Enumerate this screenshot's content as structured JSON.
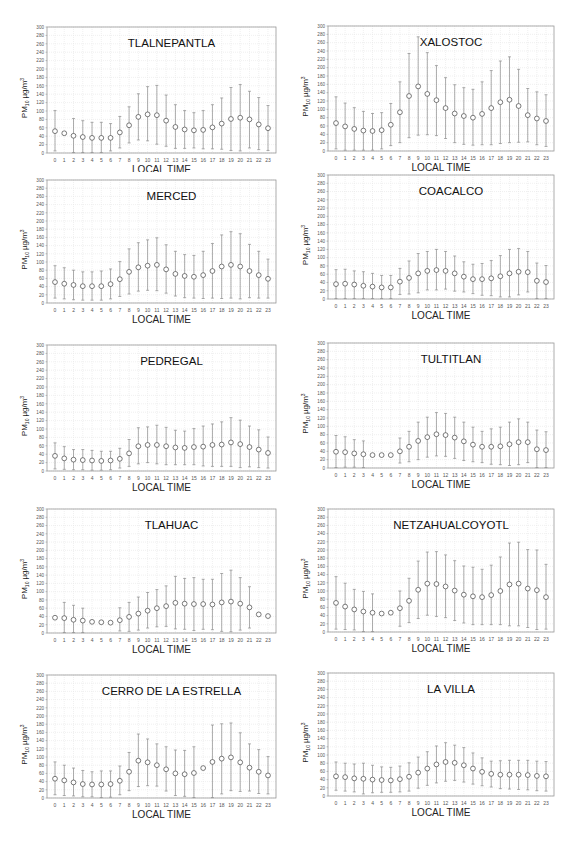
{
  "figure": {
    "ylabel_main": "PM",
    "ylabel_sub": "10",
    "ylabel_unit": "µg/m",
    "ylabel_sup": "3",
    "xlabel": "LOCAL TIME",
    "y_ticks": [
      0,
      20,
      40,
      60,
      80,
      100,
      120,
      140,
      160,
      180,
      200,
      220,
      240,
      260,
      280,
      300
    ],
    "x_ticks": [
      0,
      1,
      2,
      3,
      4,
      5,
      6,
      7,
      8,
      9,
      10,
      11,
      12,
      13,
      14,
      15,
      16,
      17,
      18,
      19,
      20,
      21,
      22,
      23
    ]
  },
  "chart_data": [
    {
      "type": "scatter",
      "title": "TLALNEPANTLA",
      "xlabel": "LOCAL TIME",
      "ylabel": "PM10 µg/m3",
      "ylim": [
        0,
        300
      ],
      "xlim": [
        0,
        23
      ],
      "grid": true,
      "x": [
        0,
        1,
        2,
        3,
        4,
        5,
        6,
        7,
        8,
        9,
        10,
        11,
        12,
        13,
        14,
        15,
        16,
        17,
        18,
        19,
        20,
        21,
        22,
        23
      ],
      "mean": [
        52,
        47,
        41,
        38,
        36,
        36,
        36,
        49,
        66,
        86,
        92,
        90,
        77,
        62,
        56,
        54,
        55,
        61,
        70,
        81,
        84,
        80,
        68,
        59
      ],
      "upper": [
        101,
        null,
        82,
        77,
        73,
        73,
        70,
        87,
        110,
        141,
        158,
        161,
        138,
        115,
        101,
        96,
        101,
        115,
        131,
        156,
        163,
        147,
        132,
        113
      ],
      "lower": [
        5,
        null,
        1,
        1,
        1,
        1,
        5,
        12,
        24,
        31,
        29,
        21,
        16,
        11,
        11,
        12,
        10,
        10,
        9,
        6,
        5,
        12,
        8,
        6
      ]
    },
    {
      "type": "scatter",
      "title": "XALOSTOC",
      "xlabel": "LOCAL TIME",
      "ylabel": "PM10 µg/m3",
      "ylim": [
        0,
        300
      ],
      "xlim": [
        0,
        23
      ],
      "grid": true,
      "x": [
        0,
        1,
        2,
        3,
        4,
        5,
        6,
        7,
        8,
        9,
        10,
        11,
        12,
        13,
        14,
        15,
        16,
        17,
        18,
        19,
        20,
        21,
        22,
        23
      ],
      "mean": [
        67,
        59,
        53,
        49,
        48,
        50,
        63,
        93,
        132,
        155,
        137,
        122,
        103,
        90,
        84,
        80,
        89,
        103,
        117,
        123,
        108,
        86,
        78,
        72
      ],
      "upper": [
        130,
        115,
        104,
        95,
        90,
        92,
        114,
        166,
        234,
        274,
        236,
        205,
        176,
        159,
        152,
        148,
        166,
        193,
        216,
        226,
        196,
        150,
        142,
        135
      ],
      "lower": [
        5,
        2,
        2,
        2,
        2,
        5,
        13,
        20,
        32,
        38,
        39,
        37,
        30,
        20,
        16,
        14,
        15,
        15,
        18,
        20,
        21,
        22,
        15,
        11
      ]
    },
    {
      "type": "scatter",
      "title": "MERCED",
      "xlabel": "LOCAL TIME",
      "ylabel": "PM10 µg/m3",
      "ylim": [
        0,
        300
      ],
      "xlim": [
        0,
        23
      ],
      "grid": true,
      "x": [
        0,
        1,
        2,
        3,
        4,
        5,
        6,
        7,
        8,
        9,
        10,
        11,
        12,
        13,
        14,
        15,
        16,
        17,
        18,
        19,
        20,
        21,
        22,
        23
      ],
      "mean": [
        51,
        47,
        44,
        41,
        41,
        41,
        46,
        58,
        76,
        87,
        91,
        93,
        82,
        71,
        66,
        64,
        68,
        78,
        89,
        93,
        89,
        78,
        68,
        59
      ],
      "upper": [
        91,
        86,
        80,
        76,
        76,
        78,
        83,
        101,
        132,
        147,
        154,
        159,
        142,
        126,
        118,
        116,
        126,
        145,
        166,
        174,
        169,
        143,
        126,
        107
      ],
      "lower": [
        12,
        10,
        8,
        7,
        7,
        7,
        10,
        16,
        22,
        29,
        31,
        30,
        24,
        17,
        13,
        12,
        11,
        12,
        11,
        12,
        10,
        13,
        12,
        12
      ]
    },
    {
      "type": "scatter",
      "title": "COACALCO",
      "xlabel": "LOCAL TIME",
      "ylabel": "PM10 µg/m3",
      "ylim": [
        0,
        300
      ],
      "xlim": [
        0,
        23
      ],
      "grid": true,
      "x": [
        0,
        1,
        2,
        3,
        4,
        5,
        6,
        7,
        8,
        9,
        10,
        11,
        12,
        13,
        14,
        15,
        16,
        17,
        18,
        19,
        20,
        21,
        22,
        23
      ],
      "mean": [
        36,
        37,
        35,
        32,
        30,
        28,
        28,
        42,
        51,
        62,
        68,
        70,
        68,
        62,
        54,
        48,
        48,
        50,
        55,
        62,
        66,
        65,
        44,
        41
      ],
      "upper": [
        71,
        72,
        68,
        66,
        62,
        57,
        57,
        74,
        92,
        110,
        115,
        120,
        115,
        104,
        90,
        84,
        86,
        93,
        105,
        120,
        122,
        115,
        87,
        81
      ],
      "lower": [
        1,
        1,
        1,
        1,
        1,
        1,
        1,
        11,
        12,
        15,
        22,
        22,
        24,
        19,
        17,
        13,
        9,
        8,
        5,
        5,
        10,
        17,
        1,
        1
      ]
    },
    {
      "type": "scatter",
      "title": "PEDREGAL",
      "xlabel": "LOCAL TIME",
      "ylabel": "PM10 µg/m3",
      "ylim": [
        0,
        300
      ],
      "xlim": [
        0,
        23
      ],
      "grid": true,
      "x": [
        0,
        1,
        2,
        3,
        4,
        5,
        6,
        7,
        8,
        9,
        10,
        11,
        12,
        13,
        14,
        15,
        16,
        17,
        18,
        19,
        20,
        21,
        22,
        23
      ],
      "mean": [
        36,
        30,
        27,
        26,
        25,
        24,
        25,
        29,
        42,
        59,
        62,
        62,
        59,
        56,
        55,
        57,
        58,
        62,
        63,
        68,
        64,
        57,
        51,
        43
      ],
      "upper": [
        67,
        58,
        51,
        51,
        49,
        47,
        47,
        54,
        75,
        103,
        105,
        109,
        104,
        97,
        95,
        101,
        107,
        112,
        117,
        127,
        121,
        107,
        98,
        81
      ],
      "lower": [
        5,
        4,
        3,
        3,
        2,
        2,
        3,
        7,
        11,
        17,
        20,
        17,
        15,
        15,
        15,
        15,
        12,
        11,
        11,
        11,
        8,
        10,
        8,
        7
      ]
    },
    {
      "type": "scatter",
      "title": "TULTITLAN",
      "xlabel": "LOCAL TIME",
      "ylabel": "PM10 µg/m3",
      "ylim": [
        0,
        300
      ],
      "xlim": [
        0,
        23
      ],
      "grid": true,
      "x": [
        0,
        1,
        2,
        3,
        4,
        5,
        6,
        7,
        8,
        9,
        10,
        11,
        12,
        13,
        14,
        15,
        16,
        17,
        18,
        19,
        20,
        21,
        22,
        23
      ],
      "mean": [
        39,
        38,
        35,
        33,
        31,
        31,
        31,
        40,
        51,
        65,
        74,
        81,
        79,
        73,
        64,
        56,
        51,
        51,
        52,
        57,
        62,
        62,
        45,
        43
      ],
      "upper": [
        78,
        75,
        68,
        65,
        null,
        null,
        null,
        72,
        88,
        110,
        122,
        133,
        131,
        122,
        110,
        98,
        88,
        94,
        98,
        110,
        118,
        110,
        91,
        87
      ],
      "lower": [
        1,
        2,
        2,
        1,
        null,
        null,
        null,
        12,
        15,
        20,
        26,
        29,
        28,
        23,
        18,
        15,
        13,
        9,
        8,
        6,
        8,
        13,
        1,
        1
      ]
    },
    {
      "type": "scatter",
      "title": "TLAHUAC",
      "xlabel": "LOCAL TIME",
      "ylabel": "PM10 µg/m3",
      "ylim": [
        0,
        300
      ],
      "xlim": [
        0,
        23
      ],
      "grid": true,
      "x": [
        0,
        1,
        2,
        3,
        4,
        5,
        6,
        7,
        8,
        9,
        10,
        11,
        12,
        13,
        14,
        15,
        16,
        17,
        18,
        19,
        20,
        21,
        22,
        23
      ],
      "mean": [
        37,
        36,
        32,
        30,
        27,
        26,
        25,
        31,
        39,
        47,
        54,
        60,
        65,
        73,
        71,
        70,
        70,
        69,
        74,
        76,
        71,
        62,
        45,
        41
      ],
      "upper": [
        null,
        74,
        67,
        60,
        null,
        null,
        null,
        61,
        74,
        87,
        98,
        105,
        114,
        137,
        132,
        134,
        130,
        130,
        144,
        152,
        134,
        112,
        null,
        null
      ],
      "lower": [
        null,
        1,
        1,
        1,
        null,
        null,
        null,
        5,
        4,
        7,
        12,
        15,
        16,
        10,
        9,
        6,
        9,
        8,
        4,
        3,
        7,
        12,
        null,
        null
      ]
    },
    {
      "type": "scatter",
      "title": "NETZAHUALCOYOTL",
      "xlabel": "LOCAL TIME",
      "ylabel": "PM10 µg/m3",
      "ylim": [
        0,
        300
      ],
      "xlim": [
        0,
        23
      ],
      "grid": true,
      "x": [
        0,
        1,
        2,
        3,
        4,
        5,
        6,
        7,
        8,
        9,
        10,
        11,
        12,
        13,
        14,
        15,
        16,
        17,
        18,
        19,
        20,
        21,
        22,
        23
      ],
      "mean": [
        71,
        62,
        55,
        50,
        47,
        45,
        47,
        58,
        76,
        103,
        118,
        117,
        111,
        101,
        91,
        87,
        85,
        90,
        100,
        116,
        118,
        106,
        102,
        85
      ],
      "upper": [
        135,
        119,
        104,
        99,
        93,
        null,
        null,
        100,
        131,
        173,
        195,
        196,
        188,
        174,
        161,
        158,
        153,
        163,
        183,
        217,
        219,
        201,
        200,
        165
      ],
      "lower": [
        7,
        6,
        5,
        1,
        1,
        null,
        null,
        14,
        23,
        33,
        41,
        38,
        35,
        28,
        22,
        18,
        18,
        18,
        18,
        15,
        15,
        11,
        6,
        7
      ]
    },
    {
      "type": "scatter",
      "title": "CERRO DE LA ESTRELLA",
      "xlabel": "LOCAL TIME",
      "ylabel": "PM10 µg/m3",
      "ylim": [
        0,
        300
      ],
      "xlim": [
        0,
        23
      ],
      "grid": true,
      "x": [
        0,
        1,
        2,
        3,
        4,
        5,
        6,
        7,
        8,
        9,
        10,
        11,
        12,
        13,
        14,
        15,
        16,
        17,
        18,
        19,
        20,
        21,
        22,
        23
      ],
      "mean": [
        47,
        43,
        38,
        34,
        33,
        33,
        34,
        42,
        64,
        91,
        87,
        80,
        70,
        60,
        58,
        61,
        73,
        88,
        96,
        99,
        87,
        74,
        64,
        55
      ],
      "upper": [
        88,
        80,
        73,
        67,
        64,
        66,
        66,
        78,
        111,
        156,
        144,
        132,
        125,
        117,
        116,
        125,
        null,
        178,
        181,
        183,
        159,
        132,
        118,
        101
      ],
      "lower": [
        8,
        6,
        5,
        3,
        3,
        1,
        2,
        8,
        18,
        28,
        30,
        29,
        17,
        6,
        4,
        1,
        null,
        1,
        10,
        18,
        16,
        17,
        11,
        10
      ]
    },
    {
      "type": "scatter",
      "title": "LA VILLA",
      "xlabel": "LOCAL TIME",
      "ylabel": "PM10 µg/m3",
      "ylim": [
        0,
        300
      ],
      "xlim": [
        0,
        23
      ],
      "grid": true,
      "x": [
        0,
        1,
        2,
        3,
        4,
        5,
        6,
        7,
        8,
        9,
        10,
        11,
        12,
        13,
        14,
        15,
        16,
        17,
        18,
        19,
        20,
        21,
        22,
        23
      ],
      "mean": [
        48,
        46,
        43,
        42,
        40,
        39,
        38,
        41,
        47,
        57,
        67,
        77,
        83,
        81,
        75,
        67,
        59,
        54,
        52,
        52,
        52,
        51,
        49,
        48
      ],
      "upper": [
        83,
        80,
        78,
        80,
        75,
        71,
        70,
        73,
        81,
        95,
        108,
        122,
        130,
        124,
        118,
        105,
        93,
        85,
        86,
        87,
        87,
        87,
        85,
        84
      ],
      "lower": [
        14,
        12,
        10,
        5,
        8,
        9,
        9,
        10,
        12,
        19,
        26,
        32,
        36,
        38,
        34,
        29,
        25,
        22,
        18,
        17,
        16,
        15,
        13,
        12
      ]
    }
  ]
}
